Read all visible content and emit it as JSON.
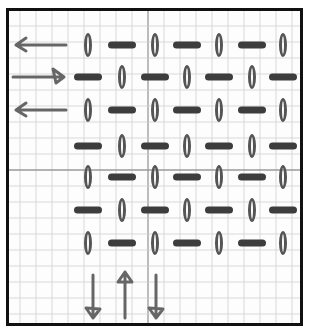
{
  "diagram": {
    "title": "Hand-drawn grid pattern of alternating vertical ovals and horizontal dashes with direction arrows",
    "paper": {
      "type": "grid paper",
      "grid_spacing_px": 16,
      "border_color": "#111111",
      "grid_color": "#cfcfcf",
      "grid_major_color": "#9a9a9a"
    },
    "colors": {
      "oval": "#555555",
      "dash": "#3d3d3d",
      "arrow": "#666666"
    },
    "columns_x": [
      88,
      122,
      155,
      187,
      219,
      252,
      283
    ],
    "rows": [
      {
        "y": 45,
        "pattern": [
          "oval",
          "dash",
          "oval",
          "dash",
          "oval",
          "dash",
          "oval"
        ],
        "arrow": "left"
      },
      {
        "y": 77,
        "pattern": [
          "dash",
          "oval",
          "dash",
          "oval",
          "dash",
          "oval",
          "dash"
        ],
        "arrow": "right"
      },
      {
        "y": 110,
        "pattern": [
          "oval",
          "dash",
          "oval",
          "dash",
          "oval",
          "dash",
          "oval"
        ],
        "arrow": "left"
      },
      {
        "y": 146,
        "pattern": [
          "dash",
          "oval",
          "dash",
          "oval",
          "dash",
          "oval",
          "dash"
        ],
        "arrow": null
      },
      {
        "y": 177,
        "pattern": [
          "oval",
          "dash",
          "oval",
          "dash",
          "oval",
          "dash",
          "oval"
        ],
        "arrow": null
      },
      {
        "y": 210,
        "pattern": [
          "dash",
          "oval",
          "dash",
          "oval",
          "dash",
          "oval",
          "dash"
        ],
        "arrow": null
      },
      {
        "y": 243,
        "pattern": [
          "oval",
          "dash",
          "oval",
          "dash",
          "oval",
          "dash",
          "oval"
        ],
        "arrow": null
      }
    ],
    "bottom_arrows": [
      {
        "x": 93,
        "direction": "down"
      },
      {
        "x": 125,
        "direction": "up"
      },
      {
        "x": 156,
        "direction": "down"
      }
    ],
    "side_arrows": [
      {
        "y": 45,
        "direction": "left"
      },
      {
        "y": 77,
        "direction": "right"
      },
      {
        "y": 110,
        "direction": "left"
      }
    ]
  }
}
